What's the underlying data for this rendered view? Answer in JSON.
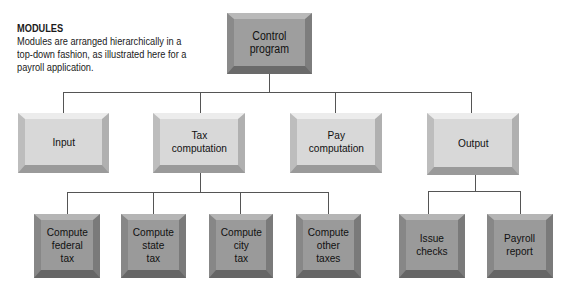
{
  "caption": {
    "title": "MODULES",
    "body": "Modules are arranged hierarchically in a top-down fashion, as illustrated here for a payroll application."
  },
  "root": {
    "label": "Control\nprogram"
  },
  "level2": [
    {
      "label": "Input"
    },
    {
      "label": "Tax\ncomputation"
    },
    {
      "label": "Pay\ncomputation"
    },
    {
      "label": "Output"
    }
  ],
  "tax_children": [
    {
      "label": "Compute\nfederal\ntax"
    },
    {
      "label": "Compute\nstate\ntax"
    },
    {
      "label": "Compute\ncity\ntax"
    },
    {
      "label": "Compute\nother\ntaxes"
    }
  ],
  "output_children": [
    {
      "label": "Issue\nchecks"
    },
    {
      "label": "Payroll\nreport"
    }
  ],
  "colors": {
    "root_fill": "#9e9e9e",
    "level2_fill": "#d8d8d8",
    "level3_fill": "#9a9a9a",
    "connector": "#555555"
  }
}
